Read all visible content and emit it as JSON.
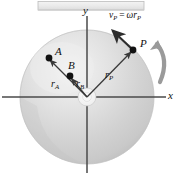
{
  "figure": {
    "background_color": "#ffffff"
  },
  "top_bar": {
    "name": "support-bar",
    "fill": "#eeeeee",
    "stroke": "#b8b8b8"
  },
  "disk": {
    "name": "rotating-disk",
    "center_x": 87,
    "center_y": 97,
    "radius": 67,
    "fill_light": "#f2f2f2",
    "fill_mid": "#d8d8d8",
    "fill_dark": "#c2c2c2",
    "edge_color": "#a8a8a8",
    "hub_fill": "#f6f6f6"
  },
  "axes": {
    "color": "#4a4a4a",
    "x_label": "x",
    "y_label": "y",
    "x_label_pos": {
      "x": 168,
      "y": 91
    },
    "y_label_pos": {
      "x": 83,
      "y": 6
    }
  },
  "points": [
    {
      "id": "A",
      "label": "A",
      "x": 49,
      "y": 58,
      "label_x": 55,
      "label_y": 47,
      "dot_r": 3.4
    },
    {
      "id": "B",
      "label": "B",
      "x": 70,
      "y": 76,
      "label_x": 68,
      "label_y": 61,
      "dot_r": 3.4
    },
    {
      "id": "P",
      "label": "P",
      "x": 133,
      "y": 50,
      "label_x": 140,
      "label_y": 39,
      "dot_r": 3.4
    }
  ],
  "vectors": [
    {
      "id": "r_A",
      "base": "r",
      "sub": "A",
      "from_x": 87,
      "from_y": 97,
      "to_x": 50,
      "to_y": 60,
      "label_x": 52,
      "label_y": 80
    },
    {
      "id": "r_B",
      "base": "r",
      "sub": "B",
      "from_x": 87,
      "from_y": 97,
      "to_x": 71,
      "to_y": 78,
      "label_x": 77,
      "label_y": 80
    },
    {
      "id": "r_P",
      "base": "r",
      "sub": "P",
      "from_x": 87,
      "from_y": 97,
      "to_x": 131,
      "to_y": 52,
      "label_x": 106,
      "label_y": 71
    }
  ],
  "velocity": {
    "id": "v_P",
    "from_x": 133,
    "from_y": 50,
    "to_x": 111,
    "to_y": 29,
    "label": {
      "v": "v",
      "v_sub": "P",
      "eq": "=",
      "omega": "ω",
      "r": "r",
      "r_sub": "P"
    },
    "label_x": 110,
    "label_y": 12
  },
  "rotation_arrow": {
    "name": "angular-rotation-arrow",
    "direction": "counter-clockwise",
    "color": "#9a9a9a"
  }
}
